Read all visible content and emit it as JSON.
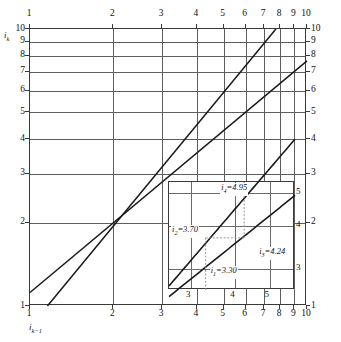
{
  "axes": {
    "y_label": "i",
    "y_label_sub": "k",
    "x_label": "i",
    "x_label_sub": "k−1",
    "top_ticks": [
      "1",
      "2",
      "3",
      "4",
      "5",
      "6",
      "7",
      "8",
      "9",
      "10"
    ],
    "bottom_ticks": [
      "1",
      "2",
      "3",
      "4",
      "5",
      "6",
      "7",
      "8",
      "9",
      "10"
    ],
    "left_ticks": [
      "1",
      "2",
      "3",
      "4",
      "5",
      "6",
      "7",
      "8",
      "9",
      "10"
    ],
    "right_ticks": [
      "1",
      "2",
      "3",
      "4",
      "5",
      "6",
      "7",
      "8",
      "9",
      "10"
    ]
  },
  "inset": {
    "x_ticks": [
      "3",
      "4",
      "5"
    ],
    "y_ticks": [
      "3",
      "4",
      "5"
    ],
    "annotations": [
      {
        "name": "i1",
        "var": "i",
        "sub": "1",
        "text": "i₁=3.30",
        "value": "3.30"
      },
      {
        "name": "i2",
        "var": "i",
        "sub": "2",
        "text": "i₂=3.70",
        "value": "3.70"
      },
      {
        "name": "i3",
        "var": "i",
        "sub": "3",
        "text": "i₃=4.24",
        "value": "4.24"
      },
      {
        "name": "i4",
        "var": "i",
        "sub": "4",
        "text": "i₄=4.95",
        "value": "4.95"
      }
    ],
    "label_i1_v": "i",
    "label_i1_s": "1",
    "label_i1_e": "=3.30",
    "label_i2_v": "i",
    "label_i2_s": "2",
    "label_i2_e": "=3.70",
    "label_i3_v": "i",
    "label_i3_s": "3",
    "label_i3_e": "=4.24",
    "label_i4_v": "i",
    "label_i4_s": "4",
    "label_i4_e": "=4.95"
  },
  "chart_data": {
    "type": "line",
    "title": "",
    "xlabel": "i_{k-1}",
    "ylabel": "i_k",
    "xscale": "log",
    "yscale": "log",
    "xlim": [
      1,
      10
    ],
    "ylim": [
      1,
      10
    ],
    "grid": true,
    "legend": "none",
    "x_ticks": [
      1,
      2,
      3,
      4,
      5,
      6,
      7,
      8,
      9,
      10
    ],
    "y_ticks": [
      1,
      2,
      3,
      4,
      5,
      6,
      7,
      8,
      9,
      10
    ],
    "series": [
      {
        "name": "steep-line",
        "description": "steeper straight line on log-log axes, passes through (2,2)",
        "points": [
          [
            1.2,
            1.0
          ],
          [
            2.0,
            2.0
          ],
          [
            3.3,
            3.7
          ],
          [
            4.24,
            4.95
          ],
          [
            8.0,
            10.0
          ]
        ]
      },
      {
        "name": "shallow-line",
        "description": "shallower straight line on log-log axes, passes through (2,2)",
        "points": [
          [
            1.0,
            1.12
          ],
          [
            2.0,
            2.0
          ],
          [
            3.3,
            3.05
          ],
          [
            4.24,
            3.7
          ],
          [
            10.0,
            7.7
          ]
        ]
      }
    ],
    "annotations": [
      {
        "label": "i₁=3.30",
        "x": 3.3,
        "y": 3.05
      },
      {
        "label": "i₂=3.70",
        "x": 3.3,
        "y": 3.7
      },
      {
        "label": "i₃=4.24",
        "x": 4.24,
        "y": 3.7
      },
      {
        "label": "i₄=4.95",
        "x": 4.24,
        "y": 4.95
      }
    ],
    "inset": {
      "xlim": [
        2.6,
        5.9
      ],
      "ylim": [
        2.6,
        5.4
      ],
      "x_ticks": [
        3,
        4,
        5
      ],
      "y_ticks": [
        3,
        4,
        5
      ]
    }
  }
}
